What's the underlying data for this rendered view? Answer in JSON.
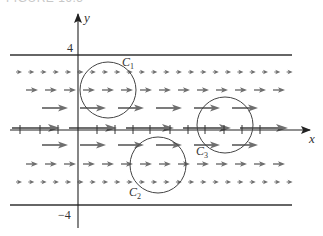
{
  "caption": "FIGURE 16.5",
  "axes": {
    "x_label": "x",
    "y_label": "y",
    "y_top_tick": "4",
    "y_bottom_tick": "−4"
  },
  "curves": [
    {
      "label": "C",
      "sub": "1"
    },
    {
      "label": "C",
      "sub": "2"
    },
    {
      "label": "C",
      "sub": "3"
    }
  ],
  "field": {
    "description": "horizontal vector field F = (4 - y^2?) i, strongest along x-axis, zero at y = ±4",
    "arrow_color": "#707070"
  },
  "colors": {
    "axis": "#222222",
    "arrow": "#6e6e6e",
    "circle": "#444444"
  }
}
